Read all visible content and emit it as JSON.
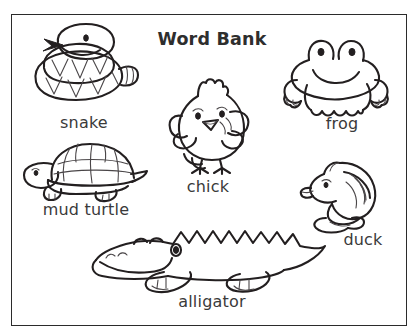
{
  "worksheet": {
    "title": "Word Bank",
    "background_color": "#ffffff",
    "ink_color": "#231f20",
    "text_color": "#3a3a3a",
    "border_color": "#2b2b2b"
  },
  "items": [
    {
      "id": "snake",
      "label": "snake",
      "icon": "snake-line-drawing"
    },
    {
      "id": "chick",
      "label": "chick",
      "icon": "chick-line-drawing"
    },
    {
      "id": "frog",
      "label": "frog",
      "icon": "frog-line-drawing"
    },
    {
      "id": "mud_turtle",
      "label": "mud turtle",
      "icon": "turtle-line-drawing"
    },
    {
      "id": "duck",
      "label": "duck",
      "icon": "duck-line-drawing"
    },
    {
      "id": "alligator",
      "label": "alligator",
      "icon": "alligator-line-drawing"
    }
  ]
}
